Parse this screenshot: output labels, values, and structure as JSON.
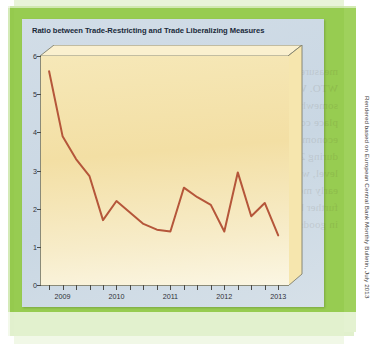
{
  "figure": {
    "title": "Ratio between Trade-Restricting and Trade Liberalizing Measures",
    "credit": "Rendered based on European Central Bank Monthly Bulletin, July 2013",
    "colors": {
      "line": "#b5563a",
      "panel_top": "#f6e8b8",
      "panel_bottom": "#fbf6e3",
      "card_background": "#ccd9e4",
      "page_border": "#8cc63f",
      "axis": "#4a4a46",
      "title_text": "#1a2a3a"
    }
  },
  "chart_data": {
    "type": "line",
    "title": "Ratio between Trade-Restricting and Trade Liberalizing Measures",
    "xlabel": "",
    "ylabel": "",
    "ylim": [
      0,
      6
    ],
    "yticks": [
      0,
      1,
      2,
      3,
      4,
      5,
      6
    ],
    "ytick_labels": [
      "0",
      "1",
      "2",
      "3",
      "4",
      "5",
      "6"
    ],
    "xtick_labels": [
      "2009",
      "2010",
      "2011",
      "2012",
      "2013"
    ],
    "xtick_values": [
      2009,
      2010,
      2011,
      2012,
      2013
    ],
    "xlim": [
      2008.6,
      2013.2
    ],
    "x_minor_interval": 0.25,
    "grid": false,
    "legend": null,
    "series": [
      {
        "name": "Ratio of trade-restricting to trade-liberalizing measures",
        "color": "#b5563a",
        "x": [
          2008.75,
          2009.0,
          2009.25,
          2009.5,
          2009.75,
          2010.0,
          2010.25,
          2010.5,
          2010.75,
          2011.0,
          2011.25,
          2011.5,
          2011.75,
          2012.0,
          2012.25,
          2012.5,
          2012.75
        ],
        "values": [
          5.6,
          3.9,
          3.3,
          2.85,
          1.7,
          2.2,
          1.9,
          1.6,
          1.45,
          1.4,
          2.55,
          2.3,
          2.1,
          1.4,
          2.95,
          1.8,
          2.15
        ]
      }
    ],
    "series_tail": {
      "x": [
        2013.0
      ],
      "values": [
        1.3
      ]
    }
  }
}
